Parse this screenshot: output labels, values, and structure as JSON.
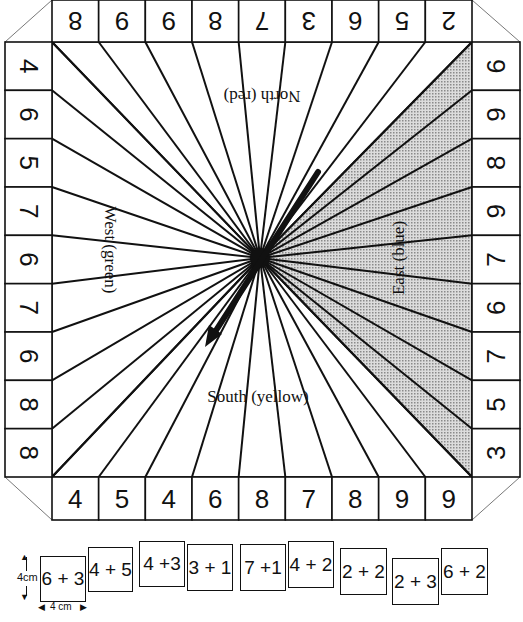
{
  "board": {
    "top_row": {
      "orientation": "rotated-180",
      "values": [
        "8",
        "9",
        "9",
        "8",
        "7",
        "3",
        "6",
        "5",
        "2"
      ]
    },
    "left_column": {
      "orientation": "rotated-90-cw",
      "values": [
        "4",
        "6",
        "5",
        "7",
        "6",
        "7",
        "6",
        "8",
        "8"
      ]
    },
    "right_column": {
      "orientation": "rotated-90-ccw",
      "values": [
        "6",
        "9",
        "8",
        "9",
        "7",
        "6",
        "7",
        "5",
        "3"
      ]
    },
    "bottom_row": {
      "orientation": "upright",
      "values": [
        "4",
        "5",
        "4",
        "6",
        "8",
        "7",
        "8",
        "9",
        "9"
      ]
    },
    "regions": {
      "north": {
        "label": "North (red)"
      },
      "west": {
        "label": "West (green)"
      },
      "east": {
        "label": "East (blue)",
        "shading": "#c8c8c8"
      },
      "south": {
        "label": "South (yellow)"
      }
    },
    "spinner": {
      "icon": "spinner-arrow-icon",
      "pointing": "south-west"
    }
  },
  "cards": [
    {
      "label": "6 + 3"
    },
    {
      "label": "4 + 5"
    },
    {
      "label": "4 +3"
    },
    {
      "label": "3 + 1"
    },
    {
      "label": "7 +1"
    },
    {
      "label": "4 + 2"
    },
    {
      "label": "2 + 2"
    },
    {
      "label": "2 + 3"
    },
    {
      "label": "6 + 2"
    }
  ],
  "dimensions": {
    "height_label": "4cm",
    "width_label": "4 cm"
  },
  "colors": {
    "ink": "#111111",
    "east_shade": "#c8c8c8",
    "background": "#ffffff"
  }
}
